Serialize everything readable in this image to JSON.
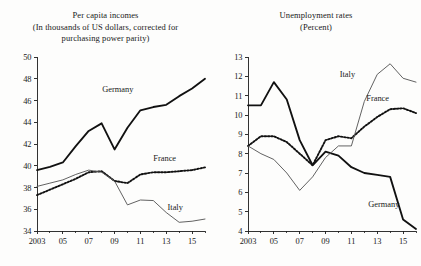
{
  "figure": {
    "width": 421,
    "height": 266,
    "background": "#fdfdfc",
    "ink_color": "#111111",
    "italy_color": "#5a5a5a"
  },
  "chart_data": [
    {
      "id": "per-capita-incomes",
      "type": "line",
      "title": "Per capita incomes",
      "subtitle_lines": [
        "(In thousands of US dollars, corrected for",
        "purchasing power parity)"
      ],
      "xlabel": "",
      "ylabel": "",
      "xlim": [
        2003,
        2016
      ],
      "ylim": [
        34,
        50
      ],
      "ytick_step": 2,
      "yticks": [
        34,
        36,
        38,
        40,
        42,
        44,
        46,
        48,
        50
      ],
      "ytick_labels": [
        "34",
        "36",
        "38",
        "40",
        "42",
        "44",
        "46",
        "48",
        "50"
      ],
      "xticks": [
        2003,
        2005,
        2007,
        2009,
        2011,
        2013,
        2015
      ],
      "xtick_labels": [
        "2003",
        "05",
        "07",
        "09",
        "11",
        "13",
        "15"
      ],
      "x": [
        2003,
        2004,
        2005,
        2006,
        2007,
        2008,
        2009,
        2010,
        2011,
        2012,
        2013,
        2014,
        2015,
        2016
      ],
      "grid": false,
      "legend_position": "inline-annotations",
      "series": [
        {
          "name": "Germany",
          "style": "solid-thick",
          "label_x": 2008.05,
          "label_y": 46.75,
          "values": [
            39.6,
            39.9,
            40.3,
            41.8,
            43.2,
            43.9,
            41.5,
            43.5,
            45.1,
            45.4,
            45.6,
            46.4,
            47.1,
            48.0
          ]
        },
        {
          "name": "France",
          "style": "dotted",
          "label_x": 2012.0,
          "label_y": 40.45,
          "values": [
            37.3,
            37.8,
            38.3,
            38.8,
            39.4,
            39.5,
            38.6,
            38.4,
            39.2,
            39.4,
            39.4,
            39.5,
            39.6,
            39.85
          ]
        },
        {
          "name": "Italy",
          "style": "solid-thin",
          "label_x": 2013.1,
          "label_y": 35.95,
          "values": [
            38.1,
            38.4,
            38.7,
            39.2,
            39.6,
            39.4,
            38.6,
            36.4,
            36.85,
            36.8,
            35.7,
            34.8,
            34.9,
            35.1
          ]
        }
      ]
    },
    {
      "id": "unemployment-rates",
      "type": "line",
      "title": "Unemployment rates",
      "subtitle_lines": [
        "(Percent)"
      ],
      "xlabel": "",
      "ylabel": "",
      "xlim": [
        2003,
        2016
      ],
      "ylim": [
        4,
        13
      ],
      "ytick_step": 1,
      "yticks": [
        4,
        5,
        6,
        7,
        8,
        9,
        10,
        11,
        12,
        13
      ],
      "ytick_labels": [
        "4",
        "5",
        "6",
        "7",
        "8",
        "9",
        "10",
        "11",
        "12",
        "13"
      ],
      "xticks": [
        2003,
        2005,
        2007,
        2009,
        2011,
        2013,
        2015
      ],
      "xtick_labels": [
        "2003",
        "05",
        "07",
        "09",
        "11",
        "13",
        "15"
      ],
      "x": [
        2003,
        2004,
        2005,
        2006,
        2007,
        2008,
        2009,
        2010,
        2011,
        2012,
        2013,
        2014,
        2015,
        2016
      ],
      "grid": false,
      "legend_position": "inline-annotations",
      "series": [
        {
          "name": "Germany",
          "style": "solid-thick",
          "label_x": 2012.3,
          "label_y": 5.25,
          "values": [
            10.5,
            10.5,
            11.7,
            10.8,
            8.7,
            7.4,
            8.1,
            7.9,
            7.3,
            7.0,
            6.9,
            6.8,
            4.6,
            4.1
          ]
        },
        {
          "name": "France",
          "style": "dotted",
          "label_x": 2012.15,
          "label_y": 10.75,
          "values": [
            8.4,
            8.9,
            8.9,
            8.6,
            8.0,
            7.4,
            8.7,
            8.9,
            8.8,
            9.4,
            9.9,
            10.3,
            10.35,
            10.1
          ]
        },
        {
          "name": "Italy",
          "style": "solid-thin",
          "label_x": 2010.1,
          "label_y": 11.95,
          "values": [
            8.4,
            8.0,
            7.7,
            7.0,
            6.1,
            6.8,
            7.8,
            8.4,
            8.4,
            10.7,
            12.1,
            12.65,
            11.9,
            11.7
          ]
        }
      ]
    }
  ]
}
